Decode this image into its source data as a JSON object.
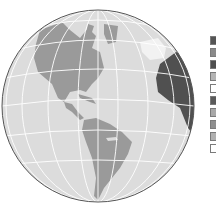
{
  "map": {
    "projection": "orthographic",
    "view": "Western hemisphere (Americas)",
    "colors": {
      "ocean": "#dcdcdc",
      "land": "#9a9a9a",
      "highlight_land": "#505050",
      "snow": "#f2f2f2",
      "graticule": "#ffffff",
      "outline": "#555555"
    }
  },
  "legend": {
    "swatches": [
      {
        "color": "#555555"
      },
      {
        "color": "#8a8a8a"
      },
      {
        "color": "#4e4e4e"
      },
      {
        "color": "#b4b4b4"
      },
      {
        "color": "#ffffff"
      },
      {
        "color": "#5a5a5a"
      },
      {
        "color": "#a8a8a8"
      },
      {
        "color": "#8e8e8e"
      },
      {
        "color": "#b0b0b0"
      },
      {
        "color": "#ffffff"
      }
    ]
  }
}
